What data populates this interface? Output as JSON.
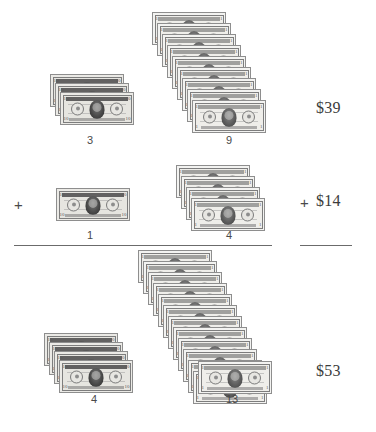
{
  "problem": {
    "type": "place-value-addition-with-money",
    "rows": [
      {
        "id": "addend-1",
        "operator": "",
        "tens_count": "3",
        "ones_count": "9",
        "amount": "$39",
        "tens_value": 10,
        "ones_value": 1
      },
      {
        "id": "addend-2",
        "operator": "+",
        "tens_count": "1",
        "ones_count": "4",
        "amount": "$14",
        "amount_operator": "+",
        "tens_value": 10,
        "ones_value": 1
      },
      {
        "id": "sum",
        "operator": "",
        "tens_count": "4",
        "ones_count": "13",
        "amount": "$53",
        "tens_value": 10,
        "ones_value": 1
      }
    ],
    "bill_faces": {
      "ten": {
        "corner": "10",
        "name": "ten-dollar-bill"
      },
      "one": {
        "corner": "1",
        "name": "one-dollar-bill"
      }
    },
    "colors": {
      "page_background": "#ffffff",
      "ink": "#3a3a3a",
      "rule": "#6b6b6b",
      "bill_border": "#8e8e8e",
      "bill_paper": "#f3f3f1"
    }
  }
}
